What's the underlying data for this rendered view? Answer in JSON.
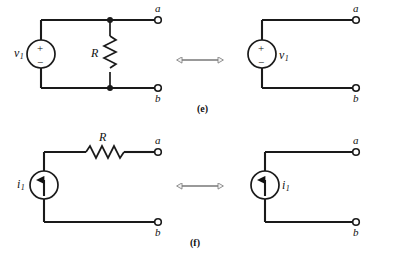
{
  "figure": {
    "type": "circuit-equivalence-diagram",
    "panels": [
      {
        "caption": "(e)",
        "left_circuit": {
          "source": {
            "kind": "voltage-source",
            "symbol": "circle-plus-minus",
            "label_base": "v",
            "label_sub": "1",
            "plus": "+",
            "minus": "−"
          },
          "resistor": {
            "label": "R",
            "orientation": "vertical",
            "connection": "parallel"
          },
          "terminals": [
            {
              "name": "a",
              "position": "top-right"
            },
            {
              "name": "b",
              "position": "bottom-right"
            }
          ],
          "junction_dots": 2
        },
        "relation_arrow": "double-headed-horizontal-arrow",
        "right_circuit": {
          "source": {
            "kind": "voltage-source",
            "symbol": "circle-plus-minus",
            "label_base": "v",
            "label_sub": "1",
            "plus": "+",
            "minus": "−"
          },
          "resistor": null,
          "terminals": [
            {
              "name": "a",
              "position": "top-right"
            },
            {
              "name": "b",
              "position": "bottom-right"
            }
          ],
          "junction_dots": 0
        }
      },
      {
        "caption": "(f)",
        "left_circuit": {
          "source": {
            "kind": "current-source",
            "symbol": "circle-up-arrow",
            "label_base": "i",
            "label_sub": "1"
          },
          "resistor": {
            "label": "R",
            "orientation": "horizontal",
            "connection": "series"
          },
          "terminals": [
            {
              "name": "a",
              "position": "top-right"
            },
            {
              "name": "b",
              "position": "bottom-right"
            }
          ],
          "junction_dots": 0
        },
        "relation_arrow": "double-headed-horizontal-arrow",
        "right_circuit": {
          "source": {
            "kind": "current-source",
            "symbol": "circle-up-arrow",
            "label_base": "i",
            "label_sub": "1"
          },
          "resistor": null,
          "terminals": [
            {
              "name": "a",
              "position": "top-right"
            },
            {
              "name": "b",
              "position": "bottom-right"
            }
          ],
          "junction_dots": 0
        }
      }
    ]
  },
  "colors": {
    "wire": "#1a1a1a",
    "text": "#111111",
    "arrow_fill": "#f2f2f2",
    "arrow_stroke": "#777777",
    "background": "#ffffff"
  },
  "labels": {
    "e_caption": "(e)",
    "f_caption": "(f)",
    "R_e": "R",
    "R_f": "R",
    "v_base": "v",
    "v_sub": "1",
    "i_base": "i",
    "i_sub": "1",
    "term_a_e_left": "a",
    "term_b_e_left": "b",
    "term_a_e_right": "a",
    "term_b_e_right": "b",
    "term_a_f_left": "a",
    "term_b_f_left": "b",
    "term_a_f_right": "a",
    "term_b_f_right": "b",
    "plus": "+",
    "minus": "−"
  }
}
